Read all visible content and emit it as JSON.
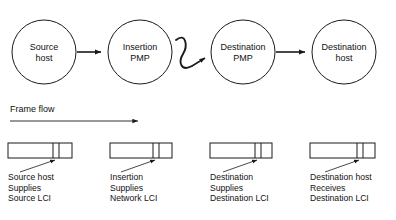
{
  "diagram": {
    "title_visible": false,
    "stroke_color": "#1a1a1a",
    "background_color": "#ffffff",
    "flow": {
      "label": "Frame flow",
      "arrow_direction": "right"
    },
    "nodes": [
      {
        "id": "source-host",
        "line1": "Source",
        "line2": "host",
        "cx": 44,
        "cy": 52,
        "r": 32
      },
      {
        "id": "insertion-pmp",
        "line1": "Insertion",
        "line2": "PMP",
        "cx": 140,
        "cy": 52,
        "r": 32
      },
      {
        "id": "destination-pmp",
        "line1": "Destination",
        "line2": "PMP",
        "cx": 243,
        "cy": 52,
        "r": 32
      },
      {
        "id": "destination-host",
        "line1": "Destination",
        "line2": "host",
        "cx": 344,
        "cy": 52,
        "r": 32
      }
    ],
    "connectors": [
      {
        "id": "source-to-insertion",
        "type": "arrow",
        "from": "source-host",
        "to": "insertion-pmp"
      },
      {
        "id": "insertion-to-destination",
        "type": "squiggle",
        "from": "insertion-pmp",
        "to": "destination-pmp"
      },
      {
        "id": "destination-pmp-to-host",
        "type": "arrow",
        "from": "destination-pmp",
        "to": "destination-host"
      }
    ],
    "frames": [
      {
        "id": "frame-1",
        "x": 8,
        "y": 143,
        "width": 64,
        "height": 15,
        "divider1": 45,
        "divider2": 51,
        "pointer_x": 48,
        "caption": [
          "Source host",
          "Supplies",
          "Source LCI"
        ]
      },
      {
        "id": "frame-2",
        "x": 110,
        "y": 143,
        "width": 62,
        "height": 15,
        "divider1": 43,
        "divider2": 49,
        "pointer_x": 46,
        "caption": [
          "Insertion",
          "Supplies",
          "Network LCI"
        ]
      },
      {
        "id": "frame-3",
        "x": 210,
        "y": 143,
        "width": 62,
        "height": 15,
        "divider1": 45,
        "divider2": 51,
        "pointer_x": 48,
        "caption": [
          "Destination",
          "Supplies",
          "Destination LCI"
        ]
      },
      {
        "id": "frame-4",
        "x": 310,
        "y": 143,
        "width": 65,
        "height": 15,
        "divider1": 47,
        "divider2": 53,
        "pointer_x": 50,
        "caption": [
          "Destination host",
          "Receives",
          "Destination LCI"
        ]
      }
    ]
  }
}
